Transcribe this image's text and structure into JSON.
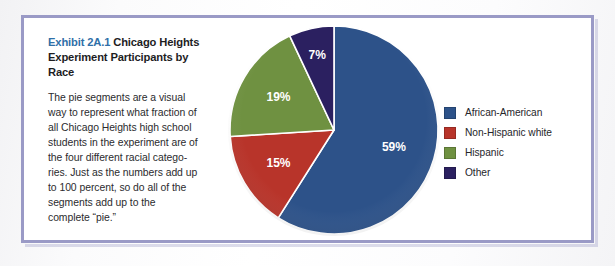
{
  "figure": {
    "exhibit_number": "Exhibit 2A.1",
    "title_rest": "Chicago Heights Experiment Participants by Race",
    "caption": "The pie segments are a visual way to represent what fraction of all Chicago Heights high school students in the experiment are of the four different racial catego-ries. Just as the numbers add up to 100 percent, so do all of the segments add up to the complete “pie.”",
    "frame_color": "#9a9ac6",
    "exhibit_number_color": "#2f6fa8"
  },
  "chart_data": {
    "type": "pie",
    "title": "Exhibit 2A.1 Chicago Heights Experiment Participants by Race",
    "categories": [
      "African-American",
      "Non-Hispanic white",
      "Hispanic",
      "Other"
    ],
    "values": [
      59,
      15,
      19,
      7
    ],
    "value_labels": [
      "59%",
      "15%",
      "19%",
      "7%"
    ],
    "unit": "percent",
    "total": 100,
    "colors": [
      "#2d5289",
      "#b8342a",
      "#6f9141",
      "#2b2060"
    ],
    "start_angle_deg": 0,
    "direction": "clockwise",
    "legend_position": "right",
    "label_position": "inside",
    "label_color": "#ffffff",
    "slice_border_color": "#ffffff",
    "xlabel": "",
    "ylabel": ""
  },
  "legend": {
    "items": [
      {
        "label": "African-American",
        "color": "#2d5289"
      },
      {
        "label": "Non-Hispanic white",
        "color": "#b8342a"
      },
      {
        "label": "Hispanic",
        "color": "#6f9141"
      },
      {
        "label": "Other",
        "color": "#2b2060"
      }
    ]
  }
}
